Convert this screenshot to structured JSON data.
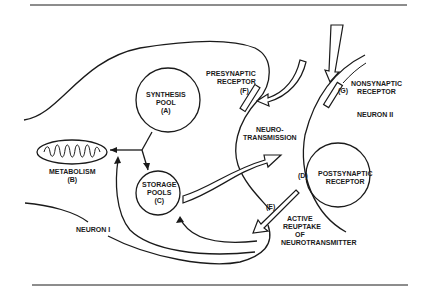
{
  "diagram": {
    "labels": {
      "synthesis_pool": [
        "SYNTHESIS",
        "POOL",
        "(A)"
      ],
      "metabolism": [
        "METABOLISM",
        "(B)"
      ],
      "storage_pools": [
        "STORAGE",
        "POOLS",
        "(C)"
      ],
      "postsynaptic_receptor": [
        "POSTSYNAPTIC",
        "RECEPTOR"
      ],
      "postsynaptic_code": "(D)",
      "reuptake_code": "(E)",
      "active_reuptake": [
        "ACTIVE",
        "REUPTAKE",
        "OF",
        "NEUROTRANSMITTER"
      ],
      "presynaptic_receptor": [
        "PRESYNAPTIC",
        "RECEPTOR"
      ],
      "presynaptic_code": "(F)",
      "nonsynaptic_code": "(G)",
      "nonsynaptic_receptor": [
        "NONSYNAPTIC",
        "RECEPTOR"
      ],
      "neurotransmission": [
        "NEURO-",
        "TRANSMISSION"
      ],
      "neuron_1": "NEURON I",
      "neuron_2": "NEURON II"
    },
    "colors": {
      "ink": "#1a1a1a",
      "background": "#ffffff"
    }
  }
}
